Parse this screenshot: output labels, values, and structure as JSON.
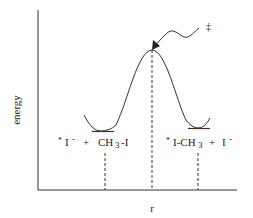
{
  "diagram": {
    "type": "reaction-energy-profile",
    "y_axis_label": "energy",
    "x_axis_label": "r",
    "transition_state_marker": "‡",
    "reactants": {
      "star": "*",
      "part1": "I",
      "charge1": "-",
      "plus": "+",
      "part2": "CH",
      "sub2": "3",
      "part2b": "-I"
    },
    "products": {
      "star": "*",
      "part1": "I-CH",
      "sub1": "3",
      "plus": "+",
      "part2": "I",
      "charge2": "-"
    }
  },
  "colors": {
    "line": "#333333",
    "background": "#ffffff"
  }
}
